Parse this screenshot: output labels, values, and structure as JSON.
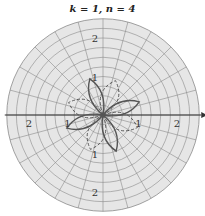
{
  "title": "k = 1, n = 4",
  "plot": {
    "type": "polar",
    "center": [
      103,
      115
    ],
    "unit_px": 38.5,
    "max_radius": 2.5,
    "ring_step": 0.25,
    "spoke_step_deg": 15,
    "colors": {
      "background": "#e6e6e6",
      "grid": "#8a8a8a",
      "axis": "#333333",
      "curve": "#555555"
    },
    "labels": [
      {
        "text": "2",
        "r": 2,
        "angle_deg": 90
      },
      {
        "text": "1",
        "r": 1,
        "angle_deg": 90
      },
      {
        "text": "2",
        "r": 2,
        "angle_deg": 180
      },
      {
        "text": "1",
        "r": 1,
        "angle_deg": 180
      },
      {
        "text": "1",
        "r": 1,
        "angle_deg": 0
      },
      {
        "text": "2",
        "r": 2,
        "angle_deg": 0
      },
      {
        "text": "1",
        "r": 1,
        "angle_deg": 270
      },
      {
        "text": "2",
        "r": 2,
        "angle_deg": 270
      }
    ],
    "solid_petals_deg": [
      20,
      110,
      200,
      290
    ],
    "dashed_petals_deg": [
      -20,
      70,
      160,
      250
    ],
    "petal_length": 1.0
  }
}
